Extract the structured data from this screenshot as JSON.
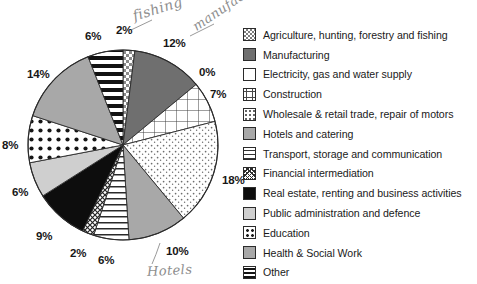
{
  "chart_data": {
    "type": "pie",
    "title": "",
    "subtitle": "",
    "xlabel": "",
    "ylabel": "",
    "grid": false,
    "legend_position": "right",
    "units": "percent",
    "start_angle_deg": 0,
    "direction": "clockwise",
    "categories": [
      "Agriculture, hunting, forestry and fishing",
      "Manufacturing",
      "Electricity, gas and water supply",
      "Construction",
      "Wholesale & retail trade, repair of motors",
      "Hotels and catering",
      "Transport, storage and communication",
      "Financial intermediation",
      "Real estate, renting and business activities",
      "Public administration and defence",
      "Education",
      "Health & Social Work",
      "Other"
    ],
    "values": [
      2,
      12,
      0,
      7,
      18,
      10,
      6,
      2,
      9,
      6,
      8,
      14,
      6
    ],
    "value_labels": [
      "2%",
      "12%",
      "0%",
      "7%",
      "18%",
      "10%",
      "6%",
      "2%",
      "9%",
      "6%",
      "8%",
      "14%",
      "6%"
    ],
    "slice_patterns": [
      "checkerboard",
      "dark-gray-solid",
      "white",
      "grid-crosshatch",
      "fine-dots",
      "medium-gray-solid",
      "horizontal-lines",
      "dense-diagonal-hatch",
      "black-solid",
      "light-gray-solid",
      "bold-dots",
      "medium-gray-solid",
      "thick-horizontal-bars"
    ]
  },
  "legend": {
    "items": [
      {
        "label": "Agriculture, hunting, forestry and fishing",
        "swatch": "checkerboard"
      },
      {
        "label": "Manufacturing",
        "swatch": "dark-gray-solid"
      },
      {
        "label": "Electricity, gas and water supply",
        "swatch": "white"
      },
      {
        "label": "Construction",
        "swatch": "grid-crosshatch"
      },
      {
        "label": "Wholesale & retail trade, repair of motors",
        "swatch": "fine-dots"
      },
      {
        "label": "Hotels and catering",
        "swatch": "medium-gray-solid"
      },
      {
        "label": "Transport, storage and communication",
        "swatch": "horizontal-lines"
      },
      {
        "label": "Financial intermediation",
        "swatch": "dense-diagonal-hatch"
      },
      {
        "label": "Real estate, renting and business activities",
        "swatch": "black-solid"
      },
      {
        "label": "Public administration and defence",
        "swatch": "light-gray-solid"
      },
      {
        "label": "Education",
        "swatch": "bold-dots"
      },
      {
        "label": "Health & Social Work",
        "swatch": "medium-gray-solid"
      },
      {
        "label": "Other",
        "swatch": "thick-horizontal-bars"
      }
    ]
  },
  "pct_labels": [
    {
      "text": "2%",
      "x": 116,
      "y": 24
    },
    {
      "text": "12%",
      "x": 163,
      "y": 37
    },
    {
      "text": "0%",
      "x": 199,
      "y": 66
    },
    {
      "text": "7%",
      "x": 210,
      "y": 88
    },
    {
      "text": "18%",
      "x": 222,
      "y": 174
    },
    {
      "text": "10%",
      "x": 166,
      "y": 245
    },
    {
      "text": "6%",
      "x": 98,
      "y": 254
    },
    {
      "text": "2%",
      "x": 70,
      "y": 247
    },
    {
      "text": "9%",
      "x": 36,
      "y": 230
    },
    {
      "text": "6%",
      "x": 12,
      "y": 186
    },
    {
      "text": "8%",
      "x": 2,
      "y": 139
    },
    {
      "text": "14%",
      "x": 27,
      "y": 68
    },
    {
      "text": "6%",
      "x": 85,
      "y": 30
    }
  ],
  "annotations": {
    "fishing": "fishing",
    "manufacturing": "manufac",
    "hotels": "Hotels"
  },
  "colors": {
    "background": "#ffffff",
    "outline": "#2b2b2b",
    "text": "#1a1a1a",
    "pencil": "#8d8d8d",
    "dark_gray": "#6f6f6f",
    "medium_gray": "#a8a8a8",
    "light_gray": "#cfcfcf",
    "black": "#0d0d0d",
    "white": "#ffffff"
  }
}
